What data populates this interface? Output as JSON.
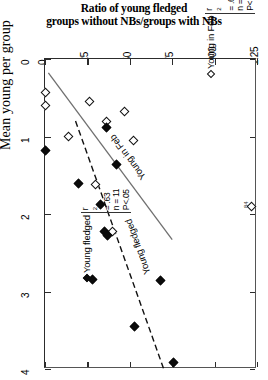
{
  "chart_data": {
    "type": "scatter",
    "title": "Ratio of young fledged groups without NBs/groups with NBs",
    "title_lines": [
      "Ratio of young fledged",
      "groups without NBs/groups with NBs"
    ],
    "xlabel": "Ratio of young fledged groups without NBs/groups with NBs",
    "ylabel": "Mean young per group",
    "xlim": [
      0,
      1.25
    ],
    "ylim": [
      0,
      4
    ],
    "y_inverted": true,
    "grid": false,
    "orientation": "rotated-90",
    "x_ticks": [
      {
        "value": 0,
        "label": "0"
      },
      {
        "value": 0.25,
        "label": ".25"
      },
      {
        "value": 0.5,
        "label": ".50"
      },
      {
        "value": 0.75,
        "label": ".75"
      },
      {
        "value": 1.0,
        "label": "1.00"
      },
      {
        "value": 1.25,
        "label": "1.25"
      }
    ],
    "y_ticks": [
      {
        "value": 0,
        "label": "0"
      },
      {
        "value": 1,
        "label": "1"
      },
      {
        "value": 2,
        "label": "2"
      },
      {
        "value": 3,
        "label": "3"
      },
      {
        "value": 4,
        "label": "4"
      }
    ],
    "series": [
      {
        "name": "Young in Feb",
        "marker": "open-diamond",
        "n": 10,
        "r2": ".69",
        "p": "P<.05",
        "line_style": "solid",
        "points": [
          {
            "x": 0.0,
            "y": 0.43
          },
          {
            "x": 0.0,
            "y": 0.6
          },
          {
            "x": 0.14,
            "y": 1.0
          },
          {
            "x": 0.26,
            "y": 0.55
          },
          {
            "x": 0.36,
            "y": 0.8
          },
          {
            "x": 0.47,
            "y": 0.68
          },
          {
            "x": 0.3,
            "y": 1.62
          },
          {
            "x": 0.4,
            "y": 2.22
          },
          {
            "x": 1.22,
            "y": 1.9
          },
          {
            "x": 0.52,
            "y": 1.05
          }
        ],
        "fit_line": {
          "x1": 0.02,
          "y1": 0.18,
          "x2": 0.75,
          "y2": 2.33
        }
      },
      {
        "name": "Young fledged",
        "marker": "filled-diamond",
        "n": 11,
        "r2": ".63",
        "p": "P<.05",
        "line_style": "dashed",
        "points": [
          {
            "x": 0.0,
            "y": 1.18
          },
          {
            "x": 0.2,
            "y": 1.6
          },
          {
            "x": 0.36,
            "y": 0.88
          },
          {
            "x": 0.42,
            "y": 1.36
          },
          {
            "x": 0.33,
            "y": 1.88
          },
          {
            "x": 0.35,
            "y": 2.22
          },
          {
            "x": 0.37,
            "y": 2.28
          },
          {
            "x": 0.28,
            "y": 2.85
          },
          {
            "x": 0.68,
            "y": 2.86
          },
          {
            "x": 0.53,
            "y": 3.45
          },
          {
            "x": 0.76,
            "y": 3.92
          }
        ],
        "fit_line": {
          "x1": 0.18,
          "y1": 0.8,
          "x2": 0.7,
          "y2": 4.0
        }
      }
    ],
    "line_labels": [
      {
        "text": "Young in Feb",
        "series": "Young in Feb"
      },
      {
        "text": "Young fledged",
        "series": "Young fledged"
      }
    ],
    "annotations": [
      {
        "text": "84",
        "near": "right-axis"
      }
    ]
  },
  "legend": {
    "young_in_feb": {
      "name": "Young in Feb",
      "r2_label": "r",
      "r2_sup": "2",
      "r2_value": "= .69",
      "n_value": "n = 10",
      "p_value": "P<.05"
    },
    "young_fledged": {
      "name": "Young fledged",
      "r2_label": "r",
      "r2_sup": "2",
      "r2_value": "= .63",
      "n_value": "n = 11",
      "p_value": "P<.05"
    }
  },
  "colors": {
    "axis": "#2c2c2c",
    "marker_fill": "#0b0b0b",
    "marker_open": "#ffffff",
    "line_solid": "#6f6f6f",
    "line_dashed": "#111111",
    "background": "#ffffff"
  }
}
